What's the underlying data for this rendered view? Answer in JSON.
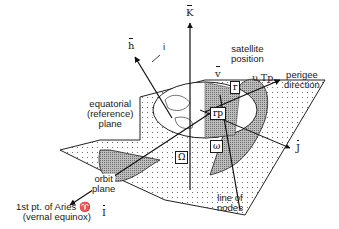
{
  "diagram": {
    "type": "orbital elements geometry",
    "axes": {
      "K": "K",
      "J": "J",
      "I": "I",
      "h": "h"
    },
    "labels": {
      "inclination": "i",
      "satellite_position_line1": "satellite",
      "satellite_position_line2": "position",
      "velocity": "v",
      "position": "r",
      "perigee_vector": "rp",
      "true_anomaly": "υ,Tp",
      "perigee_line1": "perigee",
      "perigee_line2": "direction",
      "equatorial_line1": "equatorial",
      "equatorial_line2": "(reference)",
      "equatorial_line3": "plane",
      "orbit_line1": "orbit",
      "orbit_line2": "plane",
      "raan": "Ω",
      "arg_perigee": "ω",
      "nodes_line1": "line of",
      "nodes_line2": "nodes",
      "aries_line1": "1st pt. of Aries ♈",
      "aries_line2": "(vernal equinox)"
    }
  }
}
